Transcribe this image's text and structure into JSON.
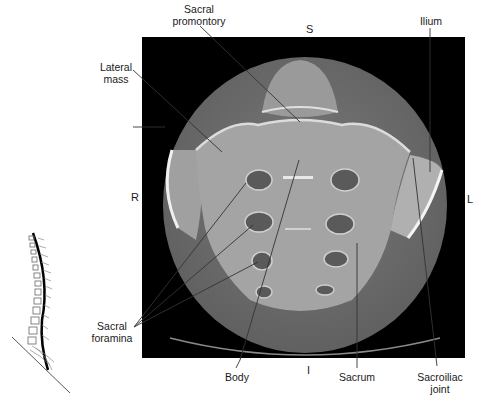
{
  "figure": {
    "type": "axial CT of sacrum with anatomical labels",
    "orientation": {
      "superior": "S",
      "inferior": "I",
      "right": "R",
      "left": "L"
    },
    "labels": {
      "sacral_promontory": [
        "Sacral",
        "promontory"
      ],
      "lateral_mass": [
        "Lateral",
        "mass"
      ],
      "ilium": [
        "Ilium"
      ],
      "sacral_foramina": [
        "Sacral",
        "foramina"
      ],
      "body": [
        "Body"
      ],
      "sacrum": [
        "Sacrum"
      ],
      "sacroiliac_joint": [
        "Sacroiliac",
        "joint"
      ]
    },
    "colors": {
      "background": "#ffffff",
      "ct_frame": "#000000",
      "soft_tissue": "#6e6e6e",
      "bone": "#a8a8a8",
      "cortex": "#e6e6e6",
      "leader_line": "#333333"
    }
  }
}
